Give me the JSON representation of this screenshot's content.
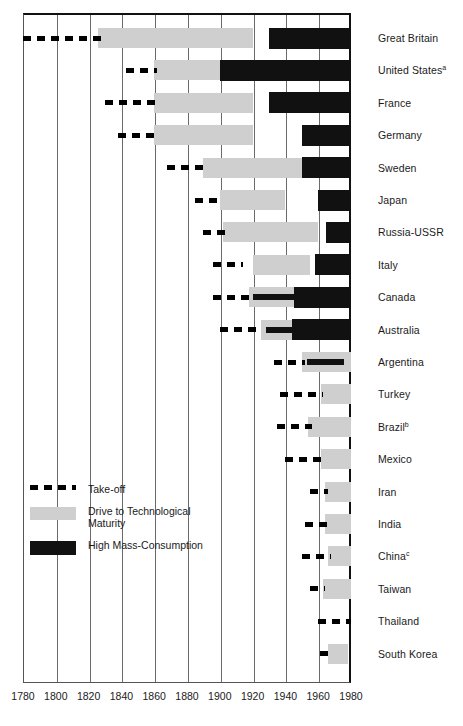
{
  "chart_data": {
    "type": "bar",
    "subtype": "stage-timeline",
    "title": "",
    "xlabel": "",
    "ylabel": "",
    "xlim": [
      1780,
      1980
    ],
    "xticks": [
      1780,
      1800,
      1820,
      1840,
      1860,
      1880,
      1900,
      1920,
      1940,
      1960,
      1980
    ],
    "grid": "vertical",
    "legend_position": "inside-lower-left",
    "legend": [
      {
        "key": "take_off",
        "label": "Take-off",
        "color": "#000000",
        "style": "dashed"
      },
      {
        "key": "drive",
        "label": "Drive to Technological Maturity",
        "color": "#cfcfcf",
        "style": "solid"
      },
      {
        "key": "mass",
        "label": "High Mass-Consumption",
        "color": "#111111",
        "style": "solid"
      }
    ],
    "categories": [
      "Great Britain",
      "United States",
      "France",
      "Germany",
      "Sweden",
      "Japan",
      "Russia-USSR",
      "Italy",
      "Canada",
      "Australia",
      "Argentina",
      "Turkey",
      "Brazil",
      "Mexico",
      "Iran",
      "India",
      "China",
      "Taiwan",
      "Thailand",
      "South Korea"
    ],
    "rows": [
      {
        "country": "Great Britain",
        "footnote": "",
        "take_off": [
          1780,
          1830
        ],
        "drive": [
          1826,
          1920
        ],
        "mass": [
          1930,
          1980
        ],
        "mass_thin": null
      },
      {
        "country": "United States",
        "footnote": "a",
        "take_off": [
          1843,
          1862
        ],
        "drive": [
          1860,
          1900
        ],
        "mass": [
          1900,
          1980
        ],
        "mass_thin": null
      },
      {
        "country": "France",
        "footnote": "",
        "take_off": [
          1830,
          1862
        ],
        "drive": [
          1860,
          1920
        ],
        "mass": [
          1930,
          1980
        ],
        "mass_thin": null
      },
      {
        "country": "Germany",
        "footnote": "",
        "take_off": [
          1838,
          1862
        ],
        "drive": [
          1860,
          1920
        ],
        "mass": [
          1950,
          1980
        ],
        "mass_thin": null
      },
      {
        "country": "Sweden",
        "footnote": "",
        "take_off": [
          1868,
          1892
        ],
        "drive": [
          1890,
          1950
        ],
        "mass": [
          1950,
          1980
        ],
        "mass_thin": null
      },
      {
        "country": "Japan",
        "footnote": "",
        "take_off": [
          1885,
          1902
        ],
        "drive": [
          1900,
          1940
        ],
        "mass": [
          1960,
          1980
        ],
        "mass_thin": null
      },
      {
        "country": "Russia-USSR",
        "footnote": "",
        "take_off": [
          1890,
          1905
        ],
        "drive": [
          1902,
          1960
        ],
        "mass": [
          1965,
          1980
        ],
        "mass_thin": null
      },
      {
        "country": "Italy",
        "footnote": "",
        "take_off": [
          1896,
          1914
        ],
        "drive": [
          1920,
          1955
        ],
        "mass": [
          1958,
          1980
        ],
        "mass_thin": null
      },
      {
        "country": "Canada",
        "footnote": "",
        "take_off": [
          1896,
          1918
        ],
        "drive": [
          1918,
          1960
        ],
        "mass": [
          1945,
          1980
        ],
        "mass_thin": [
          1920,
          1948
        ]
      },
      {
        "country": "Australia",
        "footnote": "",
        "take_off": [
          1900,
          1925
        ],
        "drive": [
          1925,
          1965
        ],
        "mass": [
          1944,
          1980
        ],
        "mass_thin": [
          1928,
          1948
        ]
      },
      {
        "country": "Argentina",
        "footnote": "",
        "take_off": [
          1933,
          1952
        ],
        "drive": [
          1950,
          1980
        ],
        "mass": null,
        "mass_thin": [
          1953,
          1976
        ]
      },
      {
        "country": "Turkey",
        "footnote": "",
        "take_off": [
          1937,
          1963
        ],
        "drive": [
          1962,
          1980
        ],
        "mass": null,
        "mass_thin": null
      },
      {
        "country": "Brazil",
        "footnote": "b",
        "take_off": [
          1935,
          1956
        ],
        "drive": [
          1954,
          1980
        ],
        "mass": null,
        "mass_thin": null
      },
      {
        "country": "Mexico",
        "footnote": "",
        "take_off": [
          1940,
          1963
        ],
        "drive": [
          1962,
          1980
        ],
        "mass": null,
        "mass_thin": null
      },
      {
        "country": "Iran",
        "footnote": "",
        "take_off": [
          1955,
          1966
        ],
        "drive": [
          1964,
          1980
        ],
        "mass": null,
        "mass_thin": null
      },
      {
        "country": "India",
        "footnote": "",
        "take_off": [
          1952,
          1966
        ],
        "drive": [
          1964,
          1980
        ],
        "mass": null,
        "mass_thin": null
      },
      {
        "country": "China",
        "footnote": "c",
        "take_off": [
          1950,
          1968
        ],
        "drive": [
          1966,
          1980
        ],
        "mass": null,
        "mass_thin": null
      },
      {
        "country": "Taiwan",
        "footnote": "",
        "take_off": [
          1955,
          1964
        ],
        "drive": [
          1963,
          1980
        ],
        "mass": null,
        "mass_thin": null
      },
      {
        "country": "Thailand",
        "footnote": "",
        "take_off": [
          1960,
          1980
        ],
        "drive": null,
        "mass": null,
        "mass_thin": null
      },
      {
        "country": "South Korea",
        "footnote": "",
        "take_off": [
          1961,
          1969
        ],
        "drive": [
          1966,
          1978
        ],
        "mass": null,
        "mass_thin": null
      }
    ]
  },
  "axis": {
    "ticks": [
      "1780",
      "1800",
      "1820",
      "1840",
      "1860",
      "1880",
      "1900",
      "1920",
      "1940",
      "1960",
      "1980"
    ]
  },
  "legend": {
    "take_off_label": "Take-off",
    "drive_label": "Drive to Technological Maturity",
    "mass_label": "High Mass-Consumption"
  },
  "colors": {
    "take_off": "#000000",
    "drive": "#cfcfcf",
    "mass": "#111111",
    "grid": "#6a6a6a",
    "frame": "#111111"
  }
}
